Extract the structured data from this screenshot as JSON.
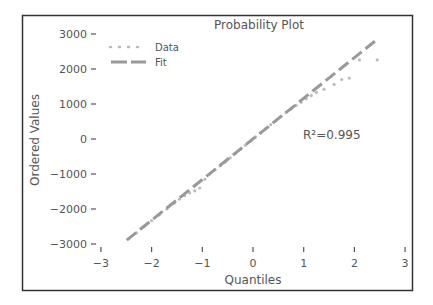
{
  "chart_data": {
    "type": "scatter",
    "title": "Probability Plot",
    "xlabel": "Quantiles",
    "ylabel": "Ordered Values",
    "xlim": [
      -3,
      3
    ],
    "ylim": [
      -3000,
      3000
    ],
    "xticks": [
      -3,
      -2,
      -1,
      0,
      1,
      2,
      3
    ],
    "xtick_labels": [
      "−3",
      "−2",
      "−1",
      "0",
      "1",
      "2",
      "3"
    ],
    "yticks": [
      3000,
      2000,
      1000,
      0,
      -1000,
      -2000,
      -3000
    ],
    "ytick_labels": [
      "3000",
      "2000",
      "1000",
      "0",
      "−1000",
      "−2000",
      "−3000"
    ],
    "grid": false,
    "legend": {
      "position": "upper left",
      "entries": [
        {
          "label": "Data",
          "style": "dotted",
          "color": "#bbbbbb"
        },
        {
          "label": "Fit",
          "style": "dashed",
          "color": "#999999"
        }
      ]
    },
    "annotation": "R²=0.995",
    "series": [
      {
        "name": "Fit",
        "kind": "line",
        "x": [
          -2.49,
          2.41
        ],
        "y": [
          -2890,
          2800
        ]
      },
      {
        "name": "Data",
        "kind": "points",
        "x": [
          -2.45,
          -2.3,
          -2.15,
          -2.0,
          -1.85,
          -1.7,
          -1.55,
          -1.45,
          -1.35,
          -1.25,
          -1.15,
          -1.05,
          -0.95,
          -0.85,
          -0.75,
          -0.65,
          -0.55,
          -0.45,
          -0.35,
          -0.25,
          -0.15,
          -0.05,
          0.05,
          0.15,
          0.25,
          0.35,
          0.45,
          0.55,
          0.65,
          0.75,
          0.85,
          0.95,
          1.05,
          1.15,
          1.25,
          1.4,
          1.6,
          1.75,
          1.9,
          2.1,
          2.45
        ],
        "y": [
          -2850,
          -2680,
          -2500,
          -2330,
          -2170,
          -2000,
          -1830,
          -1720,
          -1620,
          -1540,
          -1480,
          -1400,
          -1150,
          -1000,
          -880,
          -770,
          -660,
          -540,
          -420,
          -300,
          -180,
          -60,
          60,
          180,
          300,
          410,
          520,
          640,
          760,
          860,
          960,
          1050,
          1150,
          1240,
          1330,
          1420,
          1560,
          1700,
          1740,
          2260,
          2260
        ]
      }
    ]
  }
}
